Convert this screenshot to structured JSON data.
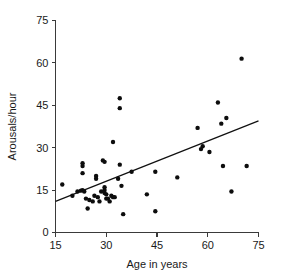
{
  "chart_data": {
    "type": "scatter",
    "title": "",
    "xlabel": "Age in years",
    "ylabel": "Arousals/hour",
    "xlim": [
      15,
      75
    ],
    "ylim": [
      0,
      75
    ],
    "xticks": [
      15,
      30,
      45,
      60,
      75
    ],
    "yticks": [
      0,
      15,
      30,
      45,
      60,
      75
    ],
    "xtick_labels": [
      "15",
      "30",
      "45",
      "60",
      "75"
    ],
    "ytick_labels": [
      "0",
      "15",
      "30",
      "45",
      "60",
      "75"
    ],
    "grid": false,
    "legend": null,
    "marker_color": "#0d0d0d",
    "line_color": "#111111",
    "axis_color": "#3a3a3a",
    "points": [
      [
        17.0,
        17.0
      ],
      [
        20.0,
        13.0
      ],
      [
        21.5,
        14.5
      ],
      [
        22.5,
        14.8
      ],
      [
        23.0,
        24.5
      ],
      [
        23.0,
        23.5
      ],
      [
        23.0,
        21.0
      ],
      [
        23.0,
        15.0
      ],
      [
        23.5,
        14.5
      ],
      [
        24.0,
        12.0
      ],
      [
        24.5,
        8.5
      ],
      [
        25.0,
        11.5
      ],
      [
        26.0,
        11.0
      ],
      [
        26.5,
        13.0
      ],
      [
        27.0,
        20.0
      ],
      [
        27.0,
        19.0
      ],
      [
        27.5,
        12.5
      ],
      [
        28.0,
        11.0
      ],
      [
        28.5,
        14.5
      ],
      [
        29.0,
        25.5
      ],
      [
        29.5,
        25.0
      ],
      [
        29.5,
        16.0
      ],
      [
        29.5,
        15.0
      ],
      [
        29.5,
        14.0
      ],
      [
        30.0,
        13.5
      ],
      [
        30.0,
        12.0
      ],
      [
        30.5,
        12.0
      ],
      [
        31.0,
        11.0
      ],
      [
        31.5,
        13.0
      ],
      [
        32.0,
        32.0
      ],
      [
        32.0,
        12.5
      ],
      [
        32.5,
        12.5
      ],
      [
        33.5,
        19.0
      ],
      [
        34.0,
        47.5
      ],
      [
        34.0,
        44.0
      ],
      [
        34.0,
        24.0
      ],
      [
        34.5,
        16.5
      ],
      [
        35.0,
        6.5
      ],
      [
        37.5,
        21.5
      ],
      [
        42.0,
        13.5
      ],
      [
        44.5,
        21.5
      ],
      [
        44.5,
        7.5
      ],
      [
        51.0,
        19.5
      ],
      [
        57.0,
        37.0
      ],
      [
        58.0,
        29.5
      ],
      [
        58.5,
        30.5
      ],
      [
        60.5,
        28.5
      ],
      [
        63.0,
        46.0
      ],
      [
        64.0,
        38.5
      ],
      [
        64.5,
        23.5
      ],
      [
        65.5,
        40.5
      ],
      [
        67.0,
        14.5
      ],
      [
        70.0,
        61.5
      ],
      [
        71.5,
        23.5
      ]
    ],
    "fit_line": {
      "x_start": 15,
      "y_start": 11.0,
      "x_end": 75,
      "y_end": 39.5
    }
  }
}
